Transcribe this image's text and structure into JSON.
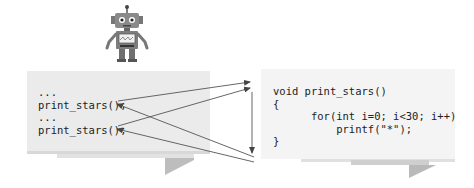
{
  "caller": {
    "lines": [
      "...",
      "print_stars();",
      "...",
      "print_stars();"
    ]
  },
  "callee": {
    "lines": [
      "void print_stars()",
      "{",
      "      for(int i=0; i<30; i++)",
      "          printf(\"*\");",
      "}"
    ]
  },
  "icons": {
    "robot": "robot-mascot-icon"
  },
  "colors": {
    "caller_bg": "#ebebeb",
    "callee_bg": "#f4f4f4",
    "arrow": "#555555",
    "fold_shadow": "#b9b9b9"
  }
}
